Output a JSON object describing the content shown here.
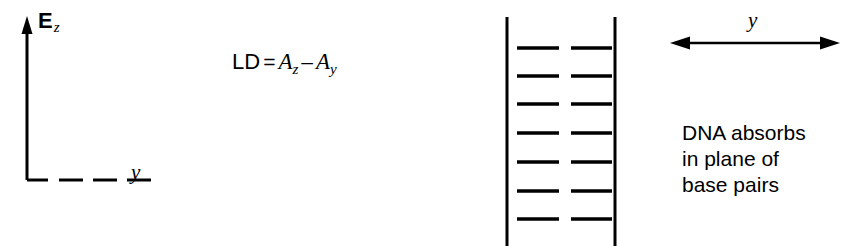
{
  "figure": {
    "background_color": "#ffffff",
    "ink_color": "#000000"
  },
  "axes": {
    "vertical_axis_label": "E",
    "vertical_axis_subscript": "z",
    "horizontal_axis_label": "y",
    "vertical_axis_name": "electric-field-z-axis",
    "horizontal_axis_name": "y-axis",
    "horizontal_axis_style": "dashed",
    "vertical_axis_style": "solid-with-arrowhead"
  },
  "equation": {
    "lhs": "LD",
    "operator_equals": "=",
    "term1_base": "A",
    "term1_subscript": "z",
    "operator_minus": "–",
    "term2_base": "A",
    "term2_subscript": "y",
    "full_text": "LD = A_z - A_y"
  },
  "dna": {
    "description": "DNA duplex schematic with two vertical backbone strands and seven horizontal base-pair rungs",
    "backbone_count": 2,
    "base_pair_rows": 7,
    "segments_per_row": 2,
    "left_backbone_x": 17,
    "right_backbone_x": 125,
    "backbone_top_y": 17,
    "backbone_bottom_y": 246,
    "rung_y_positions": [
      48,
      76,
      104,
      133,
      162,
      191,
      219
    ],
    "rung_left_start_x": 27,
    "rung_left_end_x": 69,
    "rung_right_start_x": 81,
    "rung_right_end_x": 122
  },
  "direction_arrow": {
    "label": "y",
    "style": "double-headed-horizontal",
    "name": "y-direction-arrow"
  },
  "caption": {
    "line1": "DNA absorbs",
    "line2": "in plane of",
    "line3": "base pairs"
  }
}
